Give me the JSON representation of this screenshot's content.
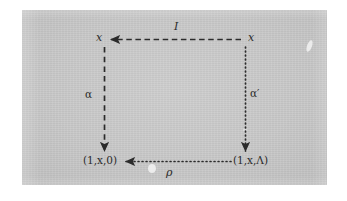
{
  "figure": {
    "kind": "commutative-square-diagram",
    "background_color": "#c9c9c9",
    "page_color": "#ffffff",
    "ink_color": "#2b2b2b",
    "vertices": {
      "top_left": "x",
      "top_right": "x",
      "bottom_left": "(1,x,0)",
      "bottom_right": "(1,x,Λ)"
    },
    "arrows": [
      {
        "id": "top-arrow",
        "label": "I",
        "style": "dashed",
        "from": "top_right",
        "to": "top_left",
        "direction": "leftward"
      },
      {
        "id": "left-arrow",
        "label": "α",
        "style": "dashed",
        "from": "top_left",
        "to": "bottom_left",
        "direction": "downward"
      },
      {
        "id": "right-arrow",
        "label": "α′",
        "style": "dotted",
        "from": "top_right",
        "to": "bottom_right",
        "direction": "downward"
      },
      {
        "id": "bottom-arrow",
        "label": "ρ",
        "style": "dotted",
        "from": "bottom_right",
        "to": "bottom_left",
        "direction": "leftward"
      }
    ]
  }
}
